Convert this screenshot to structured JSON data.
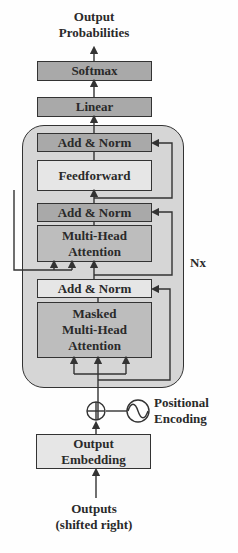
{
  "diagram": {
    "output_label_line1": "Output",
    "output_label_line2": "Probabilities",
    "softmax": "Softmax",
    "linear": "Linear",
    "decoder_block": {
      "add_norm_1": "Add & Norm",
      "feedforward": "Feedforward",
      "add_norm_2": "Add & Norm",
      "mha_line1": "Multi-Head",
      "mha_line2": "Attention",
      "add_norm_3": "Add & Norm",
      "masked_line1": "Masked",
      "masked_line2": "Multi-Head",
      "masked_line3": "Attention",
      "repeat_label": "Nx"
    },
    "positional_encoding_line1": "Positional",
    "positional_encoding_line2": "Encoding",
    "embedding_line1": "Output",
    "embedding_line2": "Embedding",
    "input_line1": "Outputs",
    "input_line2": "(shifted right)",
    "icons": {
      "add": "circle-plus-icon",
      "positional": "sine-wave-icon"
    },
    "colors": {
      "dark_box": "#a9a9a9",
      "mid_box": "#bdbdbd",
      "light_box": "#e6e6e6",
      "container": "#d6d6d6",
      "stroke": "#333333"
    }
  }
}
